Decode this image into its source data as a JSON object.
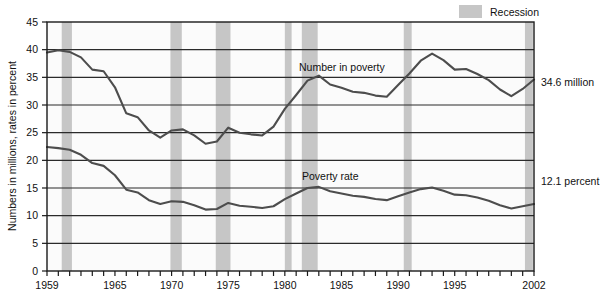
{
  "chart_data": {
    "type": "line",
    "title": "",
    "xlabel": "",
    "ylabel": "Numbers in millions, rates in percent",
    "xlim": [
      1959,
      2002
    ],
    "ylim": [
      0,
      45
    ],
    "ytick_step": 5,
    "yticks": [
      0,
      5,
      10,
      15,
      20,
      25,
      30,
      35,
      40,
      45
    ],
    "ytick_labels": [
      "0",
      "5",
      "10",
      "15",
      "20",
      "25",
      "30",
      "35",
      "40",
      "45"
    ],
    "xticks": [
      1959,
      1960,
      1961,
      1962,
      1963,
      1964,
      1965,
      1966,
      1967,
      1968,
      1969,
      1970,
      1971,
      1972,
      1973,
      1974,
      1975,
      1976,
      1977,
      1978,
      1979,
      1980,
      1981,
      1982,
      1983,
      1984,
      1985,
      1986,
      1987,
      1988,
      1989,
      1990,
      1991,
      1992,
      1993,
      1994,
      1995,
      1996,
      1997,
      1998,
      1999,
      2000,
      2001,
      2002
    ],
    "xtick_labels_shown": [
      "1959",
      "1965",
      "1970",
      "1975",
      "1980",
      "1985",
      "1990",
      "1995",
      "2002"
    ],
    "xtick_label_years": [
      1959,
      1965,
      1970,
      1975,
      1980,
      1985,
      1990,
      1995,
      2002
    ],
    "grid": "horizontal",
    "legend_position": "top-right",
    "x": [
      1959,
      1960,
      1961,
      1962,
      1963,
      1964,
      1965,
      1966,
      1967,
      1968,
      1969,
      1970,
      1971,
      1972,
      1973,
      1974,
      1975,
      1976,
      1977,
      1978,
      1979,
      1980,
      1981,
      1982,
      1983,
      1984,
      1985,
      1986,
      1987,
      1988,
      1989,
      1990,
      1991,
      1992,
      1993,
      1994,
      1995,
      1996,
      1997,
      1998,
      1999,
      2000,
      2001,
      2002
    ],
    "series": [
      {
        "name": "Number in poverty",
        "unit": "millions",
        "label_text": "Number in poverty",
        "end_value_label": "34.6 million",
        "values": [
          39.5,
          39.9,
          39.6,
          38.6,
          36.4,
          36.1,
          33.2,
          28.5,
          27.8,
          25.4,
          24.1,
          25.4,
          25.6,
          24.5,
          23.0,
          23.4,
          25.9,
          25.0,
          24.7,
          24.5,
          26.1,
          29.3,
          31.8,
          34.4,
          35.3,
          33.7,
          33.1,
          32.4,
          32.2,
          31.7,
          31.5,
          33.6,
          35.7,
          38.0,
          39.3,
          38.1,
          36.4,
          36.5,
          35.6,
          34.5,
          32.8,
          31.6,
          32.9,
          34.6
        ]
      },
      {
        "name": "Poverty rate",
        "unit": "percent",
        "label_text": "Poverty rate",
        "end_value_label": "12.1 percent",
        "values": [
          22.4,
          22.2,
          21.9,
          21.0,
          19.5,
          19.0,
          17.3,
          14.7,
          14.2,
          12.8,
          12.1,
          12.6,
          12.5,
          11.9,
          11.1,
          11.2,
          12.3,
          11.8,
          11.6,
          11.4,
          11.7,
          13.0,
          14.0,
          15.0,
          15.2,
          14.4,
          14.0,
          13.6,
          13.4,
          13.0,
          12.8,
          13.5,
          14.2,
          14.8,
          15.1,
          14.5,
          13.8,
          13.7,
          13.3,
          12.7,
          11.9,
          11.3,
          11.7,
          12.1
        ]
      }
    ],
    "recessions": [
      {
        "start": 1960.3,
        "end": 1961.2
      },
      {
        "start": 1969.9,
        "end": 1970.9
      },
      {
        "start": 1973.9,
        "end": 1975.2
      },
      {
        "start": 1980.0,
        "end": 1980.6
      },
      {
        "start": 1981.5,
        "end": 1982.9
      },
      {
        "start": 1990.5,
        "end": 1991.2
      },
      {
        "start": 2001.2,
        "end": 2001.9
      }
    ],
    "annotations": [
      {
        "name": "series-label-number",
        "text": "Number in poverty"
      },
      {
        "name": "series-label-rate",
        "text": "Poverty rate"
      },
      {
        "name": "end-label-number",
        "text": "34.6 million"
      },
      {
        "name": "end-label-rate",
        "text": "12.1 percent"
      }
    ]
  },
  "legend": {
    "items": [
      {
        "label": "Recession",
        "swatch_color": "#c6c6c6"
      }
    ]
  },
  "colors": {
    "line": "#4d4d4d",
    "recession_band": "#c6c6c6",
    "gridline": "#2b2b2b",
    "axis": "#1a1a1a",
    "plot_background": "#fbfbfb",
    "page_background": "#ffffff",
    "text": "#111111"
  }
}
